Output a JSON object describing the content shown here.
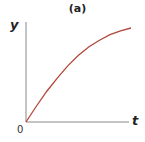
{
  "chart_data": {
    "type": "line",
    "title": "(a)",
    "xlabel": "t",
    "ylabel": "y",
    "origin_label": "0",
    "grid": false,
    "legend": null,
    "series": [
      {
        "name": "y(t)",
        "color": "#b0483a",
        "shape": "concave increasing (saturating)",
        "x": [
          0,
          0.1,
          0.2,
          0.3,
          0.4,
          0.5,
          0.6,
          0.7,
          0.8,
          0.9,
          1.0
        ],
        "values": [
          0,
          0.17,
          0.33,
          0.47,
          0.6,
          0.71,
          0.8,
          0.87,
          0.93,
          0.97,
          1.0
        ]
      }
    ],
    "xlim": [
      0,
      1
    ],
    "ylim": [
      0,
      1.05
    ]
  },
  "colors": {
    "curve": "#b0483a",
    "axes": "#888888"
  }
}
